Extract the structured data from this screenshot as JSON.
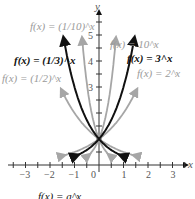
{
  "chart_data": {
    "type": "line",
    "title": "",
    "xlabel": "x",
    "ylabel": "y",
    "xlim": [
      -3.2,
      3.5
    ],
    "ylim": [
      -0.3,
      5.8
    ],
    "x_ticks": [
      -3,
      -2,
      -1,
      0,
      1,
      2,
      3
    ],
    "y_ticks": [
      3,
      4,
      5
    ],
    "x_tick_labels": [
      "−3",
      "−2",
      "−1",
      "0",
      "1",
      "2",
      "3"
    ],
    "y_tick_labels": [
      "3",
      "4",
      "5"
    ],
    "grid": false,
    "series": [
      {
        "name": "f(x) = (1/10)^x",
        "base": 0.1,
        "color": "#a6a6a6",
        "emphasis": false
      },
      {
        "name": "f(x) = (1/3)^x",
        "base": 0.3333,
        "color": "#111111",
        "emphasis": true
      },
      {
        "name": "f(x) = (1/2)^x",
        "base": 0.5,
        "color": "#a6a6a6",
        "emphasis": false
      },
      {
        "name": "f(x) = 10^x",
        "base": 10,
        "color": "#a6a6a6",
        "emphasis": false
      },
      {
        "name": "f(x) = 3^x",
        "base": 3,
        "color": "#111111",
        "emphasis": true
      },
      {
        "name": "f(x) = 2^x",
        "base": 2,
        "color": "#a6a6a6",
        "emphasis": false
      }
    ],
    "common_point": [
      0,
      1
    ],
    "caption": "f(x) = a^x"
  },
  "labels": {
    "one_tenth": "f(x) = (1/10)^x",
    "one_third": "f(x) = (1/3)^x",
    "one_half": "f(x) = (1/2)^x",
    "ten": "f(x) = 10^x",
    "three": "f(x) = 3^x",
    "two": "f(x) = 2^x",
    "x_axis": "x",
    "y_axis": "y",
    "caption": "f(x) = a^x"
  }
}
